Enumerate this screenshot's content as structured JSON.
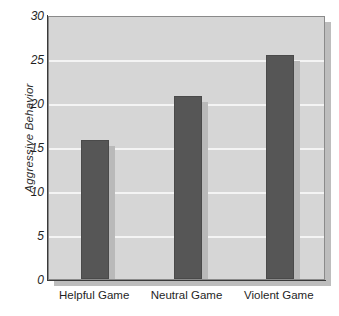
{
  "chart_data": {
    "type": "bar",
    "title": "",
    "subtitle": "",
    "xlabel": "",
    "ylabel": "Aggressive Behavior",
    "categories": [
      "Helpful Game",
      "Neutral Game",
      "Violent Game"
    ],
    "values": [
      15.8,
      20.8,
      25.5
    ],
    "ylim": [
      0,
      30
    ],
    "yticks": [
      0,
      5,
      10,
      15,
      20,
      25,
      30
    ],
    "ytick_labels": [
      "0",
      "5",
      "10",
      "15",
      "20",
      "25",
      "30"
    ],
    "grid": true,
    "grid_axis": "y",
    "legend": false,
    "legend_position": "none",
    "annotations": [],
    "colors": {
      "bar_fill": "#565656",
      "bar_shadow": "#b9b9b9",
      "plot_background": "#d6d6d6",
      "gridline": "#f4f4f4",
      "axis": "#3a3a3a",
      "page_background": "#ffffff",
      "text": "#1f1f1f"
    }
  }
}
